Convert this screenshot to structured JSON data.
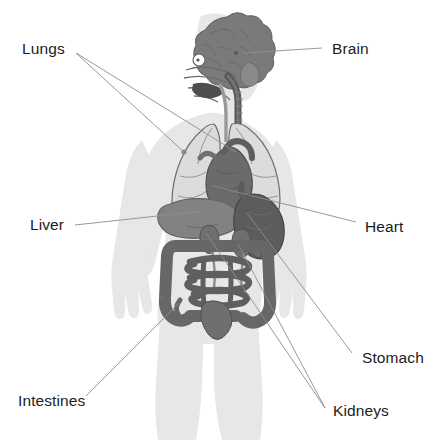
{
  "diagram": {
    "background_color": "#ffffff",
    "body_silhouette_color": "#e7e7e7",
    "leader_line_color": "#8d8d8d",
    "label_text_color": "#1c1c1c"
  },
  "labels": {
    "lungs": "Lungs",
    "brain": "Brain",
    "liver": "Liver",
    "heart": "Heart",
    "stomach": "Stomach",
    "intestines": "Intestines",
    "kidneys": "Kidneys"
  },
  "organs": [
    {
      "name": "brain",
      "label": "Brain",
      "color": "#7a7a7a",
      "side": "right",
      "label_x": 332,
      "label_y": 41
    },
    {
      "name": "lungs",
      "label": "Lungs",
      "color": "#dcdcdc",
      "side": "left",
      "label_x": 22,
      "label_y": 41
    },
    {
      "name": "heart",
      "label": "Heart",
      "color": "#6b6b6b",
      "side": "right",
      "label_x": 365,
      "label_y": 219
    },
    {
      "name": "liver",
      "label": "Liver",
      "color": "#828282",
      "side": "left",
      "label_x": 30,
      "label_y": 217
    },
    {
      "name": "stomach",
      "label": "Stomach",
      "color": "#5c5c5c",
      "side": "right",
      "label_x": 362,
      "label_y": 350
    },
    {
      "name": "intestines",
      "label": "Intestines",
      "color": "#676767",
      "side": "left",
      "label_x": 18,
      "label_y": 393
    },
    {
      "name": "kidneys",
      "label": "Kidneys",
      "color": "#6f6f6f",
      "side": "right",
      "label_x": 333,
      "label_y": 403
    }
  ],
  "leader_lines": [
    {
      "organ": "lungs",
      "from_x": 76,
      "from_y": 53,
      "to_x": 184,
      "to_y": 152
    },
    {
      "organ": "lungs",
      "from_x": 76,
      "from_y": 53,
      "to_x": 236,
      "to_y": 152
    },
    {
      "organ": "brain",
      "from_x": 322,
      "from_y": 48,
      "to_x": 244,
      "to_y": 53
    },
    {
      "organ": "liver",
      "from_x": 75,
      "from_y": 225,
      "to_x": 203,
      "to_y": 211
    },
    {
      "organ": "heart",
      "from_x": 356,
      "from_y": 222,
      "to_x": 213,
      "to_y": 186
    },
    {
      "organ": "stomach",
      "from_x": 352,
      "from_y": 353,
      "to_x": 247,
      "to_y": 213
    },
    {
      "organ": "intestines",
      "from_x": 86,
      "from_y": 396,
      "to_x": 179,
      "to_y": 303
    },
    {
      "organ": "kidneys",
      "from_x": 325,
      "from_y": 408,
      "to_x": 206,
      "to_y": 233
    },
    {
      "organ": "kidneys",
      "from_x": 325,
      "from_y": 408,
      "to_x": 238,
      "to_y": 244
    }
  ]
}
